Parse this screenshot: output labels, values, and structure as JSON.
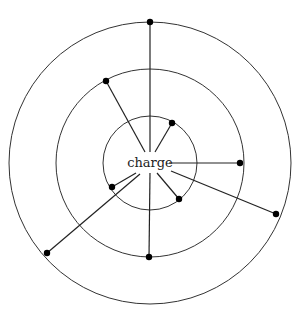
{
  "diagram": {
    "center_label": "charge",
    "center": {
      "x": 150,
      "y": 163
    },
    "rings": [
      {
        "name": "inner-ring",
        "r": 47
      },
      {
        "name": "middle-ring",
        "r": 94
      },
      {
        "name": "outer-ring",
        "r": 141
      }
    ],
    "spokes": [
      {
        "name": "spoke-top",
        "x1": 150,
        "y1": 152,
        "x2": 150,
        "y2": 22
      },
      {
        "name": "spoke-upper-left",
        "x1": 145,
        "y1": 152,
        "x2": 106,
        "y2": 81
      },
      {
        "name": "spoke-upper-right",
        "x1": 155,
        "y1": 152,
        "x2": 172,
        "y2": 123
      },
      {
        "name": "spoke-right",
        "x1": 169,
        "y1": 163,
        "x2": 240,
        "y2": 163
      },
      {
        "name": "spoke-lower-right-long",
        "x1": 171,
        "y1": 171,
        "x2": 276,
        "y2": 214
      },
      {
        "name": "spoke-bottom",
        "x1": 150,
        "y1": 173,
        "x2": 149,
        "y2": 257
      },
      {
        "name": "spoke-lower-right-short",
        "x1": 157,
        "y1": 173,
        "x2": 179,
        "y2": 199
      },
      {
        "name": "spoke-lower-left-short",
        "x1": 136,
        "y1": 173,
        "x2": 112,
        "y2": 187
      },
      {
        "name": "spoke-lower-left-long",
        "x1": 140,
        "y1": 174,
        "x2": 47,
        "y2": 253
      }
    ],
    "colors": {
      "stroke": "#222222",
      "dot": "#000000",
      "background": "#ffffff"
    }
  }
}
